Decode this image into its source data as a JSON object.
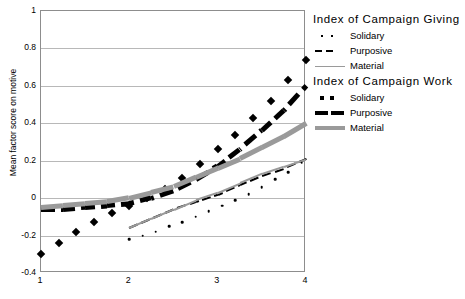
{
  "chart_data": {
    "type": "line",
    "title": "",
    "xlabel": "",
    "ylabel": "Mean factor score on motive",
    "xlim": [
      1,
      4
    ],
    "ylim": [
      -0.4,
      1.0
    ],
    "xticks": [
      "1",
      "2",
      "3",
      "4"
    ],
    "yticks": [
      "1",
      "0.8",
      "0.6",
      "0.4",
      "0.2",
      "0",
      "-0.2",
      "-0.4"
    ],
    "grid": true,
    "legend_position": "right",
    "legend_groups": [
      {
        "title": "Index of Campaign Giving",
        "entries": [
          {
            "label": "Solidary",
            "style": "dotted-thin",
            "color": "#000000"
          },
          {
            "label": "Purposive",
            "style": "dashed-thin",
            "color": "#000000"
          },
          {
            "label": "Material",
            "style": "solid-thin",
            "color": "#9a9a9a"
          }
        ]
      },
      {
        "title": "Index of Campaign Work",
        "entries": [
          {
            "label": "Solidary",
            "style": "marker-square",
            "color": "#000000"
          },
          {
            "label": "Purposive",
            "style": "dashed-thick",
            "color": "#000000"
          },
          {
            "label": "Material",
            "style": "solid-thick",
            "color": "#9a9a9a"
          }
        ]
      }
    ],
    "series": [
      {
        "name": "Campaign Work - Solidary",
        "group": "Index of Campaign Work",
        "render": "markers",
        "marker": "diamond",
        "color": "#000000",
        "x": [
          1.0,
          1.2,
          1.4,
          1.6,
          1.8,
          2.0,
          2.2,
          2.4,
          2.6,
          2.8,
          3.0,
          3.2,
          3.4,
          3.6,
          3.8,
          4.0
        ],
        "y": [
          -0.3,
          -0.24,
          -0.18,
          -0.13,
          -0.08,
          -0.04,
          0.0,
          0.05,
          0.11,
          0.18,
          0.26,
          0.34,
          0.43,
          0.52,
          0.63,
          0.74
        ]
      },
      {
        "name": "Campaign Work - Purposive",
        "group": "Index of Campaign Work",
        "render": "dashed-thick",
        "color": "#000000",
        "x": [
          1.0,
          1.25,
          1.5,
          1.75,
          2.0,
          2.25,
          2.5,
          2.75,
          3.0,
          3.25,
          3.5,
          3.75,
          4.0
        ],
        "y": [
          -0.06,
          -0.06,
          -0.05,
          -0.04,
          -0.03,
          0.0,
          0.04,
          0.1,
          0.17,
          0.26,
          0.36,
          0.47,
          0.6
        ]
      },
      {
        "name": "Campaign Work - Material",
        "group": "Index of Campaign Work",
        "render": "solid-thick",
        "color": "#9a9a9a",
        "x": [
          1.0,
          1.25,
          1.5,
          1.75,
          2.0,
          2.25,
          2.5,
          2.75,
          3.0,
          3.25,
          3.5,
          3.75,
          4.0
        ],
        "y": [
          -0.05,
          -0.04,
          -0.03,
          -0.02,
          0.0,
          0.03,
          0.06,
          0.11,
          0.16,
          0.21,
          0.27,
          0.33,
          0.4
        ]
      },
      {
        "name": "Campaign Giving - Purposive",
        "group": "Index of Campaign Giving",
        "render": "dashed-thin",
        "color": "#000000",
        "x": [
          2.0,
          2.25,
          2.5,
          2.75,
          3.0,
          3.25,
          3.5,
          3.75,
          4.0
        ],
        "y": [
          -0.16,
          -0.11,
          -0.06,
          -0.02,
          0.02,
          0.07,
          0.12,
          0.16,
          0.21
        ]
      },
      {
        "name": "Campaign Giving - Material",
        "group": "Index of Campaign Giving",
        "render": "solid-thin",
        "color": "#9a9a9a",
        "x": [
          2.0,
          2.25,
          2.5,
          2.75,
          3.0,
          3.25,
          3.5,
          3.75,
          4.0
        ],
        "y": [
          -0.16,
          -0.11,
          -0.06,
          -0.01,
          0.03,
          0.08,
          0.13,
          0.17,
          0.21
        ]
      },
      {
        "name": "Campaign Giving - Solidary",
        "group": "Index of Campaign Giving",
        "render": "dotted-thin",
        "color": "#000000",
        "x": [
          2.0,
          2.15,
          2.3,
          2.45,
          2.6,
          2.75,
          2.9,
          3.05,
          3.2,
          3.35,
          3.5,
          3.65,
          3.8,
          3.95
        ],
        "y": [
          -0.22,
          -0.2,
          -0.18,
          -0.15,
          -0.13,
          -0.1,
          -0.07,
          -0.04,
          -0.01,
          0.02,
          0.06,
          0.1,
          0.14,
          0.19
        ]
      }
    ]
  }
}
